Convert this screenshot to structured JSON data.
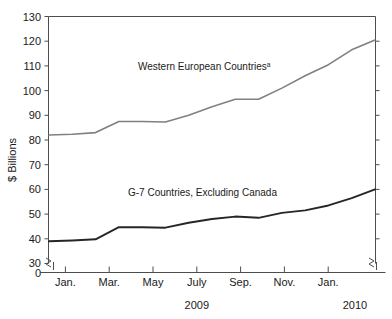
{
  "chart_data": {
    "type": "line",
    "title": "",
    "subtitle": "",
    "xlabel": "",
    "ylabel": "$ Billions",
    "ylim": [
      30,
      130
    ],
    "ytick_values": [
      30,
      40,
      50,
      60,
      70,
      80,
      90,
      100,
      110,
      120,
      130
    ],
    "ytick_labels": [
      "30",
      "40",
      "50",
      "60",
      "70",
      "80",
      "90",
      "100",
      "110",
      "120",
      "130"
    ],
    "y_zero_label": "0",
    "y_axis_break": true,
    "grid": false,
    "legend_position": "inline-annotation",
    "x": [
      "Dec.",
      "Jan.",
      "Feb.",
      "Mar.",
      "Apr.",
      "May",
      "June",
      "July",
      "Aug.",
      "Sep.",
      "Oct.",
      "Nov.",
      "Dec.",
      "Jan.",
      "Feb."
    ],
    "xtick_labels": [
      "Jan.",
      "Mar.",
      "May",
      "July",
      "Sep.",
      "Nov., ",
      "Jan."
    ],
    "xtick_labels_shown": [
      "Jan.",
      "Mar.",
      "May",
      "July",
      "Sep.",
      "Nov.",
      "Jan."
    ],
    "xtick_indices": [
      1,
      3,
      5,
      7,
      9,
      11,
      13
    ],
    "year_labels": [
      {
        "text": "2009",
        "at_index": 7
      },
      {
        "text": "2010",
        "at_index": 13
      }
    ],
    "series": [
      {
        "name": "Western European Countries",
        "superscript": "a",
        "color": "#808080",
        "label_text": "Western European Countries",
        "values": [
          82.0,
          82.3,
          83.0,
          87.5,
          87.5,
          87.3,
          90.0,
          93.5,
          96.5,
          96.5,
          101.0,
          106.0,
          110.5,
          116.5,
          120.5
        ]
      },
      {
        "name": "G-7 Countries, Excluding Canada",
        "superscript": "",
        "color": "#262626",
        "label_text": "G-7 Countries, Excluding Canada",
        "values": [
          39.0,
          39.3,
          39.8,
          44.7,
          44.7,
          44.5,
          46.5,
          48.0,
          49.0,
          48.5,
          50.5,
          51.5,
          53.5,
          56.5,
          60.0
        ]
      }
    ]
  },
  "annotations": {
    "upper_label": "Western European Countries",
    "upper_label_superscript": "a",
    "lower_label": "G-7 Countries, Excluding Canada"
  },
  "axis": {
    "y_title": "$ Billions",
    "year_2009": "2009",
    "year_2010": "2010"
  }
}
